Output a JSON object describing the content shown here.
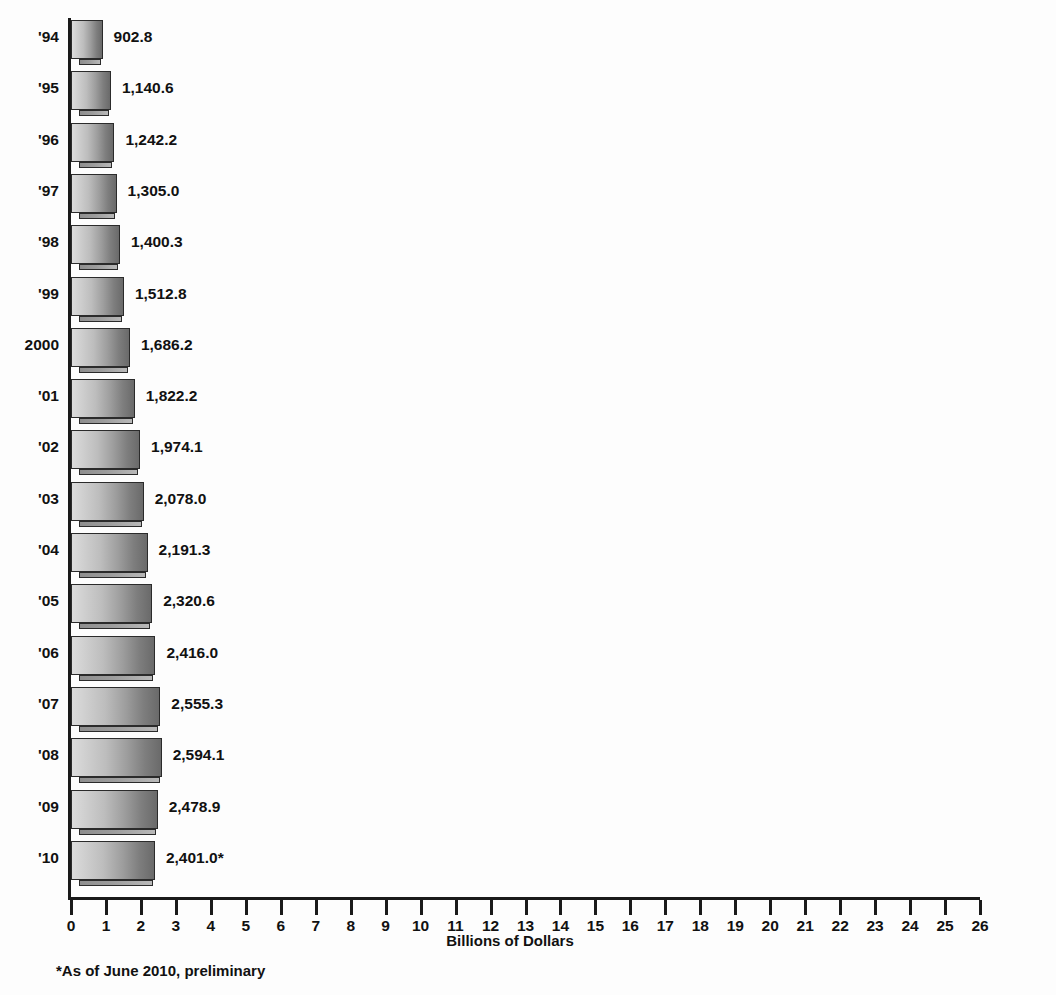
{
  "title_remnant": "",
  "chart_data": {
    "type": "bar",
    "orientation": "horizontal",
    "title": "",
    "xlabel": "Billions of Dollars",
    "ylabel": "",
    "xlim": [
      0,
      26
    ],
    "xticks": [
      0,
      1,
      2,
      3,
      4,
      5,
      6,
      7,
      8,
      9,
      10,
      11,
      12,
      13,
      14,
      15,
      16,
      17,
      18,
      19,
      20,
      21,
      22,
      23,
      24,
      25,
      26
    ],
    "xtick_labels": [
      "0",
      "1",
      "2",
      "3",
      "4",
      "5",
      "6",
      "7",
      "8",
      "9",
      "10",
      "11",
      "12",
      "13",
      "14",
      "15",
      "16",
      "17",
      "18",
      "19",
      "20",
      "21",
      "22",
      "23",
      "24",
      "25",
      "26"
    ],
    "grid": false,
    "legend": null,
    "units": "Billions of Dollars",
    "note": "Bar value labels are in millions of dollars; the axis is scaled in billions of dollars.",
    "categories": [
      "'94",
      "'95",
      "'96",
      "'97",
      "'98",
      "'99",
      "2000",
      "'01",
      "'02",
      "'03",
      "'04",
      "'05",
      "'06",
      "'07",
      "'08",
      "'09",
      "'10"
    ],
    "values": [
      902.8,
      1140.6,
      1242.2,
      1305.0,
      1400.3,
      1512.8,
      1686.2,
      1822.2,
      1974.1,
      2078.0,
      2191.3,
      2320.6,
      2416.0,
      2555.3,
      2594.1,
      2478.9,
      2401.0
    ],
    "value_labels": [
      "902.8",
      "1,140.6",
      "1,242.2",
      "1,305.0",
      "1,400.3",
      "1,512.8",
      "1,686.2",
      "1,822.2",
      "1,974.1",
      "2,078.0",
      "2,191.3",
      "2,320.6",
      "2,416.0",
      "2,555.3",
      "2,594.1",
      "2,478.9",
      "2,401.0*"
    ],
    "bars": [
      {
        "category": "'94",
        "value": 902.8,
        "label": "902.8"
      },
      {
        "category": "'95",
        "value": 1140.6,
        "label": "1,140.6"
      },
      {
        "category": "'96",
        "value": 1242.2,
        "label": "1,242.2"
      },
      {
        "category": "'97",
        "value": 1305.0,
        "label": "1,305.0"
      },
      {
        "category": "'98",
        "value": 1400.3,
        "label": "1,400.3"
      },
      {
        "category": "'99",
        "value": 1512.8,
        "label": "1,512.8"
      },
      {
        "category": "2000",
        "value": 1686.2,
        "label": "1,686.2"
      },
      {
        "category": "'01",
        "value": 1822.2,
        "label": "1,822.2"
      },
      {
        "category": "'02",
        "value": 1974.1,
        "label": "1,974.1"
      },
      {
        "category": "'03",
        "value": 2078.0,
        "label": "2,078.0"
      },
      {
        "category": "'04",
        "value": 2191.3,
        "label": "2,191.3"
      },
      {
        "category": "'05",
        "value": 2320.6,
        "label": "2,320.6"
      },
      {
        "category": "'06",
        "value": 2416.0,
        "label": "2,416.0"
      },
      {
        "category": "'07",
        "value": 2555.3,
        "label": "2,555.3"
      },
      {
        "category": "'08",
        "value": 2594.1,
        "label": "2,594.1"
      },
      {
        "category": "'09",
        "value": 2478.9,
        "label": "2,478.9"
      },
      {
        "category": "'10",
        "value": 2401.0,
        "label": "2,401.0*"
      }
    ],
    "colors": {
      "bar_light": "#dcdcdc",
      "bar_dark": "#6a6a6a",
      "bar_outline": "#2b2b2b",
      "shadow": "#9c9c9c",
      "axis": "#1a1a1a",
      "text": "#111111",
      "background": "#fdfdfd"
    }
  },
  "footnote": "*As of June 2010, preliminary"
}
